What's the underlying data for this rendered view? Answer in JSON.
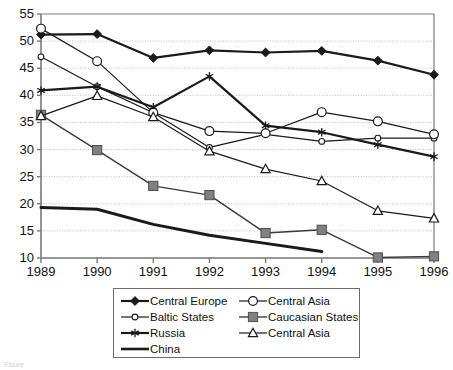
{
  "chart_data": {
    "type": "line",
    "title": "",
    "subtitle": "",
    "xlabel": "",
    "ylabel": "",
    "x": [
      "1989",
      "1990",
      "1991",
      "1992",
      "1993",
      "1994",
      "1995",
      "1996"
    ],
    "xlim": [
      1989,
      1996
    ],
    "ylim": [
      10,
      55
    ],
    "yticks": [
      10,
      15,
      20,
      25,
      30,
      35,
      40,
      45,
      50,
      55
    ],
    "xticks": [
      "1989",
      "1990",
      "1991",
      "1992",
      "1993",
      "1994",
      "1995",
      "1996"
    ],
    "grid": "horizontal-dotted",
    "legend_position": "bottom-center",
    "legend_border": true,
    "series": [
      {
        "name": "Central Europe",
        "marker": "filled-diamond",
        "color": "#1a1a1a",
        "line_width": 2.2,
        "values": [
          51.2,
          51.3,
          46.9,
          48.3,
          47.9,
          48.2,
          46.4,
          43.8
        ]
      },
      {
        "name": "Baltic States",
        "marker": "small-open-circle",
        "color": "#1a1a1a",
        "line_width": 1.2,
        "values": [
          47.1,
          41.6,
          36.8,
          30.4,
          32.8,
          31.5,
          32.1,
          32.1
        ]
      },
      {
        "name": "Russia",
        "marker": "asterisk",
        "color": "#1a1a1a",
        "line_width": 2.2,
        "values": [
          40.9,
          41.6,
          37.8,
          43.5,
          34.4,
          33.2,
          30.9,
          28.7
        ]
      },
      {
        "name": "China",
        "marker": "none",
        "color": "#1a1a1a",
        "line_width": 3.0,
        "values": [
          19.3,
          19.0,
          16.2,
          14.2,
          12.7,
          11.2,
          null,
          null
        ]
      },
      {
        "name": "Central Asia",
        "marker": "open-circle",
        "color": "#1a1a1a",
        "line_width": 1.2,
        "values": [
          52.3,
          46.3,
          36.8,
          33.4,
          33.0,
          36.9,
          35.2,
          32.8
        ]
      },
      {
        "name": "Caucasian States",
        "marker": "filled-square",
        "color": "#808080",
        "line_width": 1.4,
        "values": [
          36.4,
          29.9,
          23.3,
          21.6,
          14.6,
          15.2,
          10.1,
          10.3
        ]
      },
      {
        "name": "Central Asia",
        "marker": "open-triangle",
        "color": "#1a1a1a",
        "line_width": 1.2,
        "values": [
          36.2,
          39.9,
          36.0,
          29.7,
          26.4,
          24.2,
          18.7,
          17.3
        ]
      }
    ]
  },
  "axis": {
    "y_labels": [
      "55",
      "50",
      "45",
      "40",
      "35",
      "30",
      "25",
      "20",
      "15",
      "10"
    ],
    "x_labels": [
      "1989",
      "1990",
      "1991",
      "1992",
      "1993",
      "1994",
      "1995",
      "1996"
    ]
  },
  "legend": {
    "items": [
      {
        "label": "Central Europe",
        "marker": "filled-diamond",
        "column": "left"
      },
      {
        "label": "Central Asia",
        "marker": "open-circle",
        "column": "right"
      },
      {
        "label": "Baltic States",
        "marker": "small-open-circle",
        "column": "left"
      },
      {
        "label": "Caucasian States",
        "marker": "filled-square",
        "column": "right"
      },
      {
        "label": "Russia",
        "marker": "asterisk",
        "column": "left"
      },
      {
        "label": "Central Asia",
        "marker": "open-triangle",
        "column": "right"
      },
      {
        "label": "China",
        "marker": "none",
        "column": "left"
      }
    ]
  },
  "caption": {
    "stub": "Figure"
  },
  "colors": {
    "line": "#1a1a1a",
    "gray_marker": "#808080",
    "grid": "#b9b9b9",
    "axis": "#7a7a7a",
    "background": "#ffffff"
  }
}
